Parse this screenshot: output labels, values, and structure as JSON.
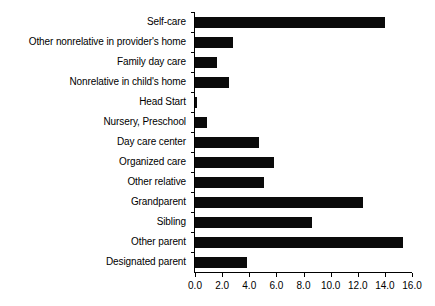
{
  "chart_data": {
    "type": "bar",
    "orientation": "horizontal",
    "title": "",
    "subtitle": "",
    "xlabel": "",
    "ylabel": "",
    "xlim": [
      0.0,
      16.0
    ],
    "xticks": [
      "0.0",
      "2.0",
      "4.0",
      "6.0",
      "8.0",
      "10.0",
      "12.0",
      "14.0",
      "16.0"
    ],
    "xtick_values": [
      0.0,
      2.0,
      4.0,
      6.0,
      8.0,
      10.0,
      12.0,
      14.0,
      16.0
    ],
    "grid": false,
    "legend": false,
    "legend_position": "none",
    "bar_color": "#0a0a0a",
    "background_color": "#ffffff",
    "axis_color": "#000000",
    "categories": [
      "Self-care",
      "Other nonrelative in provider's home",
      "Family day care",
      "Nonrelative in child's home",
      "Head Start",
      "Nursery, Preschool",
      "Day care center",
      "Organized care",
      "Other relative",
      "Grandparent",
      "Sibling",
      "Other parent",
      "Designated parent"
    ],
    "values": [
      14.0,
      2.8,
      1.6,
      2.5,
      0.15,
      0.9,
      4.7,
      5.8,
      5.1,
      12.4,
      8.6,
      15.3,
      3.8
    ]
  }
}
